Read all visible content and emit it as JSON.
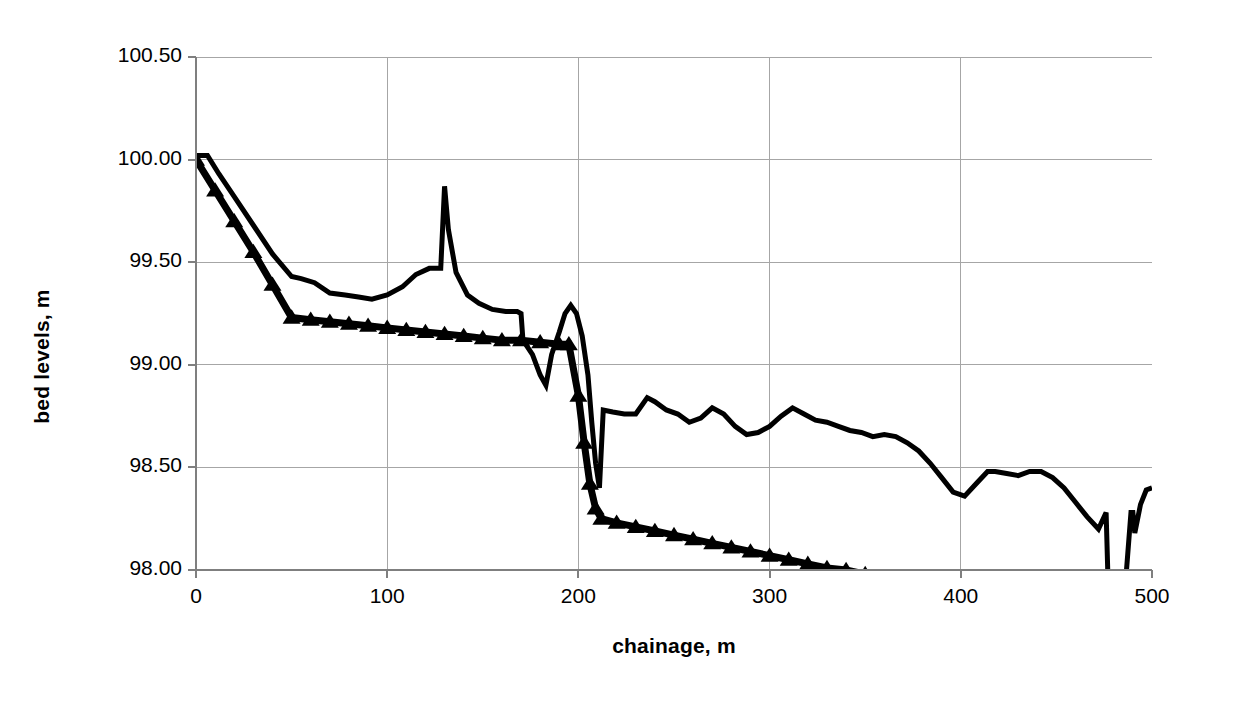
{
  "chart_data": {
    "type": "line",
    "title": "",
    "xlabel": "chainage, m",
    "ylabel": "bed levels, m",
    "xlim": [
      0,
      500
    ],
    "ylim": [
      98.0,
      100.5
    ],
    "xticks": [
      "0",
      "100",
      "200",
      "300",
      "400",
      "500"
    ],
    "xtick_values": [
      0,
      100,
      200,
      300,
      400,
      500
    ],
    "yticks": [
      "98.00",
      "98.50",
      "99.00",
      "99.50",
      "100.00",
      "100.50"
    ],
    "ytick_values": [
      98.0,
      98.5,
      99.0,
      99.5,
      100.0,
      100.5
    ],
    "grid": true,
    "legend": "none",
    "line_color": "#000000",
    "grid_color": "#a6a6a6",
    "axis_color": "#7f7f7f",
    "background": "#ffffff",
    "series": [
      {
        "name": "measured bed level",
        "marker": "none",
        "linewidth": 5,
        "x": [
          0,
          6,
          12,
          20,
          30,
          40,
          50,
          55,
          62,
          70,
          78,
          85,
          92,
          100,
          108,
          115,
          122,
          128,
          130,
          132,
          136,
          142,
          148,
          155,
          162,
          168,
          170,
          171,
          176,
          180,
          183,
          186,
          190,
          193,
          196,
          199,
          202,
          205,
          207,
          209,
          211,
          213,
          218,
          224,
          230,
          236,
          240,
          246,
          252,
          258,
          264,
          270,
          276,
          282,
          288,
          294,
          300,
          306,
          312,
          318,
          324,
          330,
          336,
          342,
          348,
          354,
          360,
          366,
          372,
          378,
          384,
          390,
          396,
          402,
          408,
          414,
          418,
          424,
          430,
          436,
          442,
          448,
          454,
          460,
          466,
          472,
          476,
          477,
          478,
          482,
          486,
          489,
          490,
          491,
          494,
          497,
          500
        ],
        "y": [
          100.02,
          100.02,
          99.93,
          99.82,
          99.68,
          99.54,
          99.43,
          99.42,
          99.4,
          99.35,
          99.34,
          99.33,
          99.32,
          99.34,
          99.38,
          99.44,
          99.47,
          99.47,
          99.87,
          99.66,
          99.45,
          99.34,
          99.3,
          99.27,
          99.26,
          99.26,
          99.25,
          99.12,
          99.05,
          98.95,
          98.9,
          99.05,
          99.16,
          99.25,
          99.29,
          99.25,
          99.14,
          98.95,
          98.72,
          98.52,
          98.4,
          98.78,
          98.77,
          98.76,
          98.76,
          98.84,
          98.82,
          98.78,
          98.76,
          98.72,
          98.74,
          98.79,
          98.76,
          98.7,
          98.66,
          98.67,
          98.7,
          98.75,
          98.79,
          98.76,
          98.73,
          98.72,
          98.7,
          98.68,
          98.67,
          98.65,
          98.66,
          98.65,
          98.62,
          98.58,
          98.52,
          98.45,
          98.38,
          98.36,
          98.42,
          98.48,
          98.48,
          98.47,
          98.46,
          98.48,
          98.48,
          98.45,
          98.4,
          98.33,
          98.26,
          98.2,
          98.28,
          97.95,
          97.9,
          97.9,
          97.92,
          98.28,
          98.28,
          98.18,
          98.32,
          98.39,
          98.4
        ]
      },
      {
        "name": "design bed level",
        "marker": "triangle",
        "linewidth": 7,
        "x": [
          0,
          10,
          20,
          30,
          40,
          50,
          60,
          70,
          80,
          90,
          100,
          110,
          120,
          130,
          140,
          150,
          160,
          170,
          180,
          190,
          195,
          200,
          203,
          206,
          209,
          212,
          220,
          230,
          240,
          250,
          260,
          270,
          280,
          290,
          300,
          310,
          320,
          330,
          340,
          350,
          360,
          370
        ],
        "y": [
          100.0,
          99.85,
          99.7,
          99.55,
          99.39,
          99.23,
          99.22,
          99.21,
          99.2,
          99.19,
          99.18,
          99.17,
          99.16,
          99.15,
          99.14,
          99.13,
          99.12,
          99.12,
          99.11,
          99.1,
          99.1,
          98.85,
          98.62,
          98.42,
          98.3,
          98.25,
          98.23,
          98.21,
          98.19,
          98.17,
          98.15,
          98.13,
          98.11,
          98.09,
          98.07,
          98.05,
          98.03,
          98.01,
          98.0,
          97.98,
          97.96,
          97.94
        ]
      }
    ]
  }
}
